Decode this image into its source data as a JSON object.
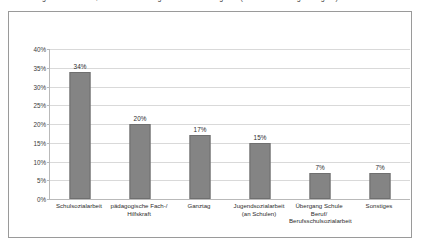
{
  "caption": {
    "text": "Abbildung 7: Arbeitsfelder, in denen die befragten Fachkräfte tätig sind (Mehrfachnennungen möglich)"
  },
  "chart_data": {
    "type": "bar",
    "title": "",
    "xlabel": "",
    "ylabel": "",
    "ylim": [
      0,
      40
    ],
    "grid": true,
    "legend": "none",
    "orientation": "vertical",
    "bar_color": "#848484",
    "categories": [
      "Schulsozialarbeit",
      "pädagogische Fach-/\nHilfskraft",
      "Ganztag",
      "Jugendsozialarbeit\n(an Schulen)",
      "Übergang Schule Beruf/\nBerufsschulsozialarbeit",
      "Sonstiges"
    ],
    "values": [
      34,
      20,
      17,
      15,
      7,
      7
    ],
    "value_labels": [
      "34%",
      "20%",
      "17%",
      "15%",
      "7%",
      "7%"
    ],
    "ytick_labels": [
      "0%",
      "5%",
      "10%",
      "15%",
      "20%",
      "25%",
      "30%",
      "35%",
      "40%"
    ],
    "ytick_values": [
      0,
      5,
      10,
      15,
      20,
      25,
      30,
      35,
      40
    ]
  }
}
